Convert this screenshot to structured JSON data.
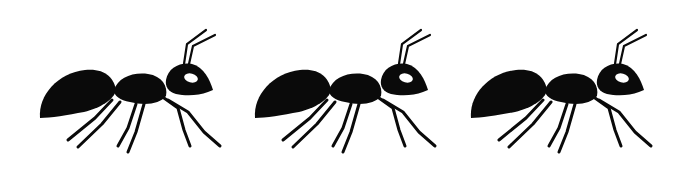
{
  "image": {
    "description": "Three identical black ant silhouettes walking right on white background",
    "background_color": "#ffffff",
    "silhouette_color": "#0a0a0a",
    "eye_color": "#ffffff",
    "ants": [
      {
        "id": 1,
        "offset_x": 0
      },
      {
        "id": 2,
        "offset_x": 215
      },
      {
        "id": 3,
        "offset_x": 431
      }
    ]
  }
}
